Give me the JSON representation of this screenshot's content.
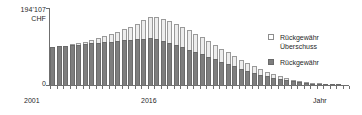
{
  "chart_data": {
    "type": "bar",
    "stacked": true,
    "title": "",
    "subtitle": "",
    "xlabel": "Jahr",
    "ylabel": "CHF",
    "y_axis_max_label": "194'107",
    "y_axis_zero_label": "0",
    "y_axis_unit": "CHF",
    "ylim": [
      0,
      194107
    ],
    "grid": false,
    "legend_position": "right",
    "x_tick_labels_shown": [
      "2001",
      "2016"
    ],
    "categories": [
      "2001",
      "2002",
      "2003",
      "2004",
      "2005",
      "2006",
      "2007",
      "2008",
      "2009",
      "2010",
      "2011",
      "2012",
      "2013",
      "2014",
      "2015",
      "2016",
      "2017",
      "2018",
      "2019",
      "2020",
      "2021",
      "2022",
      "2023",
      "2024",
      "2025",
      "2026",
      "2027",
      "2028",
      "2029",
      "2030",
      "2031",
      "2032",
      "2033",
      "2034",
      "2035",
      "2036",
      "2037",
      "2038",
      "2039",
      "2040",
      "2041",
      "2042",
      "2043",
      "2044",
      "2045",
      "2046"
    ],
    "series": [
      {
        "name": "Rückgewähr",
        "color": "#7e7e7e",
        "values": [
          96000,
          97500,
          99000,
          100500,
          102000,
          103500,
          105000,
          106500,
          108000,
          109500,
          111000,
          112500,
          114000,
          115500,
          117000,
          118500,
          116000,
          112000,
          107000,
          101000,
          95000,
          89000,
          83000,
          77000,
          71000,
          65000,
          59000,
          53000,
          47000,
          41000,
          36000,
          31000,
          26000,
          22000,
          18000,
          14500,
          11500,
          9000,
          7000,
          5200,
          3800,
          2600,
          1700,
          1000,
          500,
          0
        ]
      },
      {
        "name": "Rückgewähr Überschuss",
        "color": "#ededed",
        "values": [
          0,
          0,
          500,
          1800,
          3500,
          5500,
          8000,
          11000,
          14500,
          18500,
          23000,
          28000,
          33500,
          39500,
          46000,
          53000,
          55000,
          55500,
          55000,
          53500,
          51500,
          49000,
          46000,
          43000,
          39500,
          36000,
          32500,
          29000,
          25500,
          22000,
          19000,
          16000,
          13500,
          11000,
          9000,
          7000,
          5500,
          4200,
          3200,
          2300,
          1600,
          1100,
          700,
          400,
          200,
          0
        ]
      }
    ]
  },
  "axis": {
    "y_max_label": "194'107",
    "y_unit": "CHF",
    "y_zero_label": "0",
    "x_start_label": "2001",
    "x_mid_label": "2016",
    "x_title": "Jahr"
  },
  "legend": {
    "items": [
      {
        "label_line1": "Rückgewähr",
        "label_line2": "Überschuss",
        "swatch": "light-square-swatch"
      },
      {
        "label_line1": "Rückgewähr",
        "label_line2": "",
        "swatch": "dark-square-swatch"
      }
    ]
  }
}
